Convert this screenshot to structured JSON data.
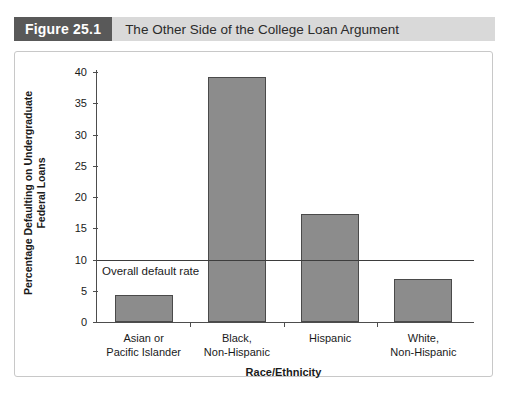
{
  "header": {
    "figure_number": "Figure 25.1",
    "title": "The Other Side of the College Loan Argument"
  },
  "chart_data": {
    "type": "bar",
    "title": "The Other Side of the College Loan Argument",
    "categories": [
      "Asian or\nPacific Islander",
      "Black,\nNon-Hispanic",
      "Hispanic",
      "White,\nNon-Hispanic"
    ],
    "category_lines": [
      [
        "Asian or",
        "Pacific Islander"
      ],
      [
        "Black,",
        "Non-Hispanic"
      ],
      [
        "Hispanic",
        ""
      ],
      [
        "White,",
        "Non-Hispanic"
      ]
    ],
    "values": [
      4.3,
      39.2,
      17.3,
      6.9
    ],
    "xlabel": "Race/Ethnicity",
    "ylabel": "Percentage Defaulting on Undergraduate Federal Loans",
    "ylabel_lines": [
      "Percentage Defaulting on Undergraduate",
      "Federal Loans"
    ],
    "ylim": [
      0,
      40
    ],
    "ytick_step": 5,
    "yticks": [
      0,
      5,
      10,
      15,
      20,
      25,
      30,
      35,
      40
    ],
    "grid": false,
    "legend": false,
    "annotations": [
      {
        "text": "Overall default rate",
        "type": "reference-line",
        "value": 10
      }
    ],
    "bar_color": "#8c8c8c",
    "bar_border_color": "#4a4a4a"
  },
  "colors": {
    "figure_number_bg": "#595959",
    "header_bg": "#d9d9d9",
    "bar_fill": "#8c8c8c",
    "axis": "#4d4d4d",
    "frame_border": "#c8c8c8"
  }
}
